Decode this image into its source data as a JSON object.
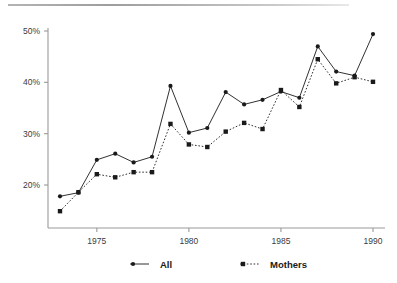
{
  "chart_data": {
    "type": "line",
    "title": "",
    "subtitle": "",
    "xlabel": "",
    "ylabel": "",
    "x": [
      1973,
      1974,
      1975,
      1976,
      1977,
      1978,
      1979,
      1980,
      1981,
      1982,
      1983,
      1984,
      1985,
      1986,
      1987,
      1988,
      1989,
      1990
    ],
    "xlim": [
      1973,
      1990
    ],
    "ylim": [
      14,
      50
    ],
    "xticks": [
      1975,
      1980,
      1985,
      1990
    ],
    "xtick_labels": [
      "1975",
      "1980",
      "1985",
      "1990"
    ],
    "yticks": [
      20,
      30,
      40,
      50
    ],
    "ytick_labels": [
      "20%",
      "30%",
      "40%",
      "50%"
    ],
    "grid": false,
    "legend_position": "bottom",
    "series": [
      {
        "name": "All",
        "marker": "circle",
        "linestyle": "solid",
        "color": "#1a1a1a",
        "values": [
          17.8,
          18.5,
          24.9,
          26.1,
          24.4,
          25.5,
          39.3,
          30.2,
          31.1,
          38.1,
          35.7,
          36.6,
          38.2,
          37.0,
          47.0,
          42.1,
          41.3,
          49.4
        ]
      },
      {
        "name": "Mothers",
        "marker": "square",
        "linestyle": "dotted",
        "color": "#1a1a1a",
        "values": [
          14.9,
          18.6,
          22.1,
          21.5,
          22.5,
          22.5,
          31.9,
          27.9,
          27.4,
          30.4,
          32.1,
          30.9,
          38.5,
          35.2,
          44.5,
          39.8,
          41.0,
          40.1
        ]
      }
    ]
  },
  "legend": {
    "items": [
      {
        "label": "All"
      },
      {
        "label": "Mothers"
      }
    ]
  },
  "axes": {
    "y_tick_0": "20%",
    "y_tick_1": "30%",
    "y_tick_2": "40%",
    "y_tick_3": "50%",
    "x_tick_0": "1975",
    "x_tick_1": "1980",
    "x_tick_2": "1985",
    "x_tick_3": "1990"
  },
  "colors": {
    "ink": "#1a1a1a",
    "axis": "#9a9a9a",
    "tick_text": "#3b3b3b",
    "rule": "#a8a8a8",
    "background": "#ffffff"
  }
}
